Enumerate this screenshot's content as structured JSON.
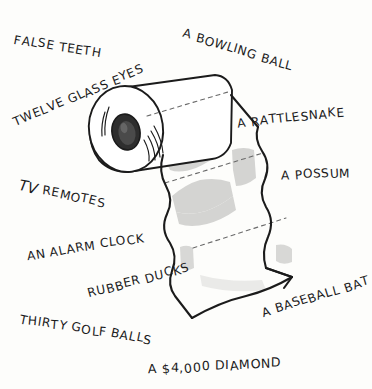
{
  "cartoon": {
    "title": "A $4,000 Diamond — toilet paper roll cartoon",
    "background_color": "#fdfdfb",
    "ink_color": "#1b1b1b",
    "shadow_color": "#d4d4d2",
    "core_color": "#2e2e2e"
  },
  "illustration": {
    "subject_name": "toilet-paper-roll",
    "parts": [
      "roll-cylinder",
      "roll-core-hole",
      "roll-core-hatching",
      "hanging-sheet",
      "perforation-dashes",
      "shadow-patches"
    ]
  },
  "labels": [
    {
      "id": "false-teeth",
      "text": "FALSE TEETH"
    },
    {
      "id": "bowling-ball",
      "text": "A BOWLING BALL"
    },
    {
      "id": "glass-eyes",
      "text": "TWELVE GLASS EYES"
    },
    {
      "id": "rattlesnake",
      "text": "A RATTLESNAKE"
    },
    {
      "id": "tv-remotes",
      "text": "TV REMOTES",
      "lead": "TV",
      "rest": " REMOTES"
    },
    {
      "id": "possum",
      "text": "A POSSUM"
    },
    {
      "id": "alarm-clock",
      "text": "AN ALARM CLOCK"
    },
    {
      "id": "rubber-ducks",
      "text": "RUBBER DUCKS"
    },
    {
      "id": "baseball-bat",
      "text": "A BASEBALL BAT"
    },
    {
      "id": "golf-balls",
      "text": "THIRTY GOLF BALLS"
    },
    {
      "id": "diamond",
      "text": "A $4,000 DIAMOND"
    }
  ]
}
